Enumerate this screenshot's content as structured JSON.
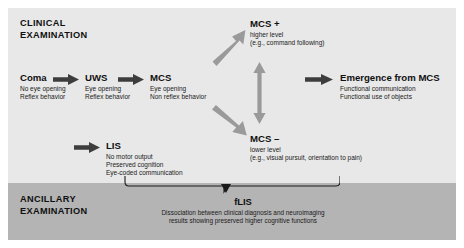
{
  "figure": {
    "width": 464,
    "height": 248,
    "background": "#ffffff"
  },
  "bands": {
    "clinical": {
      "title": "CLINICAL\nEXAMINATION",
      "color": "#e8e8e8"
    },
    "ancillary": {
      "title": "ANCILLARY\nEXAMINATION",
      "color": "#b4b4b4"
    }
  },
  "nodes": {
    "coma": {
      "title": "Coma",
      "lines": "No eye opening\nReflex behavior"
    },
    "uws": {
      "title": "UWS",
      "lines": "Eye opening\nReflex behavior"
    },
    "mcs": {
      "title": "MCS",
      "lines": "Eye opening\nNon reflex behavior"
    },
    "mcs_plus": {
      "title": "MCS +",
      "lines": "higher level\n(e.g., command following)"
    },
    "mcs_minus": {
      "title": "MCS –",
      "lines": "lower level\n(e.g., visual pursuit, orientation to pain)"
    },
    "emergence": {
      "title": "Emergence from MCS",
      "lines": "Functional communication\nFunctional use of objects"
    },
    "lis": {
      "title": "LIS",
      "lines": "No motor output\nPreserved cognition\nEye-coded communication"
    }
  },
  "flis": {
    "title": "fLIS",
    "description": "Dissociation between clinical diagnosis and neuroimaging\nresults showing preserved higher cognitive functions"
  },
  "arrows": {
    "coma_to_uws": "arrow-right-icon",
    "uws_to_mcs": "arrow-right-icon",
    "to_lis": "arrow-right-icon",
    "mcs_to_emergence": "arrow-right-icon",
    "mcs_to_mcs_plus": "arrow-diagonal-up-right-icon",
    "mcs_to_mcs_minus": "arrow-diagonal-down-right-icon",
    "mcs_plus_minus_link": "arrow-double-vertical-icon"
  },
  "colors": {
    "arrow": "#3d3d3d",
    "text": "#101010",
    "band_clinical": "#e8e8e8",
    "band_ancillary": "#b4b4b4"
  }
}
